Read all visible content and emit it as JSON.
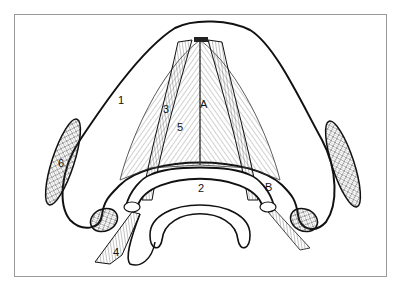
{
  "figure": {
    "type": "anatomical line drawing",
    "frame_color": "#9a9a9a",
    "line_color": "#111111",
    "labels": [
      {
        "id": "1",
        "text": "1",
        "x": 118,
        "y": 104
      },
      {
        "id": "2",
        "text": "2",
        "x": 200,
        "y": 190
      },
      {
        "id": "3",
        "text": "3",
        "x": 165,
        "y": 112
      },
      {
        "id": "5",
        "text": "5",
        "x": 178,
        "y": 130
      },
      {
        "id": "A",
        "text": "A",
        "x": 202,
        "y": 107
      },
      {
        "id": "B",
        "text": "B",
        "x": 266,
        "y": 190
      },
      {
        "id": "4",
        "text": "4",
        "x": 114,
        "y": 255
      },
      {
        "id": "6",
        "text": "6",
        "x": 58,
        "y": 166
      }
    ]
  }
}
